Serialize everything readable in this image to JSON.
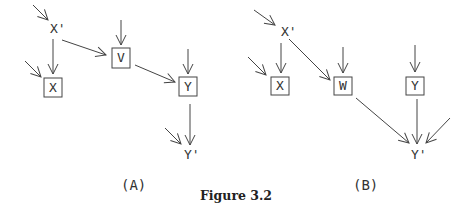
{
  "figure": {
    "caption": "Figure 3.2",
    "stroke_color": "#444444",
    "panels": [
      {
        "id": "A",
        "label": "(A)",
        "nodes": [
          {
            "id": "Xp",
            "label": "X'",
            "boxed": false
          },
          {
            "id": "X",
            "label": "X",
            "boxed": true
          },
          {
            "id": "V",
            "label": "V",
            "boxed": true
          },
          {
            "id": "Y",
            "label": "Y",
            "boxed": true
          },
          {
            "id": "Yp",
            "label": "Y'",
            "boxed": false
          }
        ],
        "edges": [
          {
            "from": "exogenous",
            "to": "X'"
          },
          {
            "from": "exogenous",
            "to": "X"
          },
          {
            "from": "X'",
            "to": "X"
          },
          {
            "from": "X'",
            "to": "V"
          },
          {
            "from": "exogenous",
            "to": "V"
          },
          {
            "from": "V",
            "to": "Y"
          },
          {
            "from": "exogenous",
            "to": "Y"
          },
          {
            "from": "Y",
            "to": "Y'"
          },
          {
            "from": "exogenous",
            "to": "Y'"
          }
        ]
      },
      {
        "id": "B",
        "label": "(B)",
        "nodes": [
          {
            "id": "Xp",
            "label": "X'",
            "boxed": false
          },
          {
            "id": "X",
            "label": "X",
            "boxed": true
          },
          {
            "id": "W",
            "label": "W",
            "boxed": true
          },
          {
            "id": "Y",
            "label": "Y",
            "boxed": true
          },
          {
            "id": "Yp",
            "label": "Y'",
            "boxed": false
          }
        ],
        "edges": [
          {
            "from": "exogenous",
            "to": "X'"
          },
          {
            "from": "exogenous",
            "to": "X"
          },
          {
            "from": "X'",
            "to": "X"
          },
          {
            "from": "X'",
            "to": "W"
          },
          {
            "from": "exogenous",
            "to": "W"
          },
          {
            "from": "exogenous",
            "to": "Y"
          },
          {
            "from": "W",
            "to": "Y'"
          },
          {
            "from": "Y",
            "to": "Y'"
          },
          {
            "from": "exogenous",
            "to": "Y'"
          }
        ]
      }
    ]
  }
}
